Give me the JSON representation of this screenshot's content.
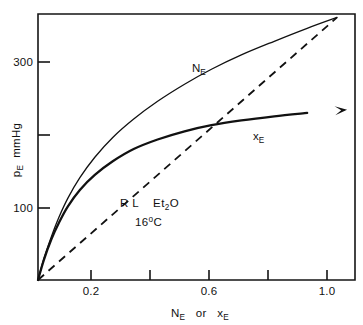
{
  "chart_data": {
    "type": "line",
    "title": "",
    "subtitle": "",
    "xlabel": "N_E  or  x_E",
    "xlabel_parts": {
      "first_base": "N",
      "first_sub": "E",
      "connector": "or",
      "second_base": "x",
      "second_sub": "E"
    },
    "ylabel": "p_E  mmHg",
    "ylabel_parts": {
      "base": "p",
      "sub": "E",
      "unit": "mmHg"
    },
    "xlim": [
      0.0,
      1.06
    ],
    "ylim": [
      0,
      390
    ],
    "grid": false,
    "legend": "none",
    "x_ticks": [
      {
        "value": 0.2,
        "label": "0.2",
        "labeled": true
      },
      {
        "value": 0.4,
        "label": "",
        "labeled": false
      },
      {
        "value": 0.6,
        "label": "0.6",
        "labeled": true
      },
      {
        "value": 0.8,
        "label": "",
        "labeled": false
      },
      {
        "value": 1.0,
        "label": "1.0",
        "labeled": true
      }
    ],
    "y_ticks": [
      {
        "value": 100,
        "label": "100",
        "labeled": true
      },
      {
        "value": 200,
        "label": "",
        "labeled": false
      },
      {
        "value": 300,
        "label": "300",
        "labeled": true
      }
    ],
    "series": [
      {
        "name": "N_E",
        "label": "N",
        "label_sub": "E",
        "style": "solid",
        "linewidth": "thin",
        "arrow": false,
        "points": [
          [
            0.0,
            0
          ],
          [
            0.02,
            32
          ],
          [
            0.045,
            64
          ],
          [
            0.07,
            92
          ],
          [
            0.1,
            120
          ],
          [
            0.14,
            150
          ],
          [
            0.19,
            180
          ],
          [
            0.25,
            209
          ],
          [
            0.32,
            236
          ],
          [
            0.4,
            262
          ],
          [
            0.49,
            287
          ],
          [
            0.58,
            309
          ],
          [
            0.68,
            330
          ],
          [
            0.79,
            350
          ],
          [
            0.9,
            369
          ],
          [
            1.0,
            385
          ]
        ]
      },
      {
        "name": "x_E",
        "label": "x",
        "label_sub": "E",
        "style": "solid",
        "linewidth": "thick",
        "arrow": true,
        "arrow_tip": [
          1.0,
          248
        ],
        "points": [
          [
            0.0,
            0
          ],
          [
            0.02,
            30
          ],
          [
            0.045,
            60
          ],
          [
            0.07,
            84
          ],
          [
            0.1,
            108
          ],
          [
            0.14,
            132
          ],
          [
            0.19,
            154
          ],
          [
            0.25,
            174
          ],
          [
            0.32,
            192
          ],
          [
            0.4,
            206
          ],
          [
            0.49,
            218
          ],
          [
            0.58,
            227
          ],
          [
            0.68,
            234
          ],
          [
            0.79,
            240
          ],
          [
            0.9,
            245
          ],
          [
            1.0,
            248
          ]
        ]
      },
      {
        "name": "raoult-ideal-line",
        "label": "",
        "label_sub": "",
        "style": "dashed",
        "linewidth": "thin",
        "arrow": false,
        "points": [
          [
            0.0,
            0
          ],
          [
            1.0,
            385
          ]
        ]
      }
    ],
    "annotations": [
      {
        "name": "sample-label",
        "line1_a": "R L",
        "line1_b": "Et",
        "line1_sub": "2",
        "line1_c": "O",
        "x": 0.27,
        "y": 115
      },
      {
        "name": "temperature-label",
        "text_a": "16",
        "text_sup": "o",
        "text_b": "C",
        "x": 0.35,
        "y": 92
      }
    ]
  },
  "figure": {
    "frame_color": "#151515",
    "curve_color": "#111111",
    "background": "#ffffff"
  }
}
